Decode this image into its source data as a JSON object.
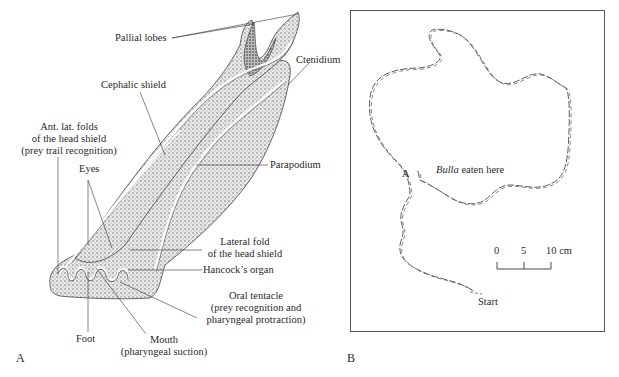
{
  "panel_a": {
    "letter": "A",
    "labels": {
      "pallial_lobes": "Pallial lobes",
      "ctenidium": "Ctenidium",
      "cephalic_shield": "Cephalic shield",
      "ant_lat_folds_1": "Ant. lat. folds",
      "ant_lat_folds_2": "of the head shield",
      "ant_lat_folds_3": "(prey trail recognition)",
      "eyes": "Eyes",
      "parapodium": "Parapodium",
      "lateral_fold_1": "Lateral fold",
      "lateral_fold_2": "of the head shield",
      "hancocks_organ": "Hancock’s organ",
      "oral_tentacle_1": "Oral tentacle",
      "oral_tentacle_2": "(prey recognition and",
      "oral_tentacle_3": "pharyngeal protraction)",
      "foot": "Foot",
      "mouth_1": "Mouth",
      "mouth_2": "(pharyngeal suction)"
    }
  },
  "panel_b": {
    "letter": "B",
    "labels": {
      "point_a": "A",
      "bulla_italic": "Bulla",
      "bulla_rest": " eaten here",
      "start": "Start"
    },
    "scale_bar": {
      "ticks": [
        "0",
        "5",
        "10 cm"
      ]
    }
  }
}
